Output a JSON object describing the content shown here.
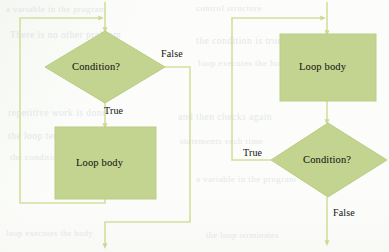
{
  "page": {
    "kind": "scanned-textbook-figure",
    "background_color": "#fcfdfa",
    "node_fill_color": "#c3d490",
    "node_stroke_color": "#b4c97f",
    "connector_color": "#d4de9e",
    "text_color": "#1c1b17"
  },
  "diagrams": [
    {
      "id": "while-loop",
      "name": "pre-test-loop-flowchart",
      "nodes": [
        {
          "id": "condition",
          "shape": "diamond",
          "label": "Condition?"
        },
        {
          "id": "body",
          "shape": "rectangle",
          "label": "Loop body"
        }
      ],
      "edges": [
        {
          "from": "entry",
          "to": "condition",
          "label": ""
        },
        {
          "from": "condition",
          "to": "body",
          "label": "True"
        },
        {
          "from": "condition",
          "to": "exit",
          "label": "False"
        },
        {
          "from": "body",
          "to": "condition",
          "label": ""
        }
      ]
    },
    {
      "id": "do-while-loop",
      "name": "post-test-loop-flowchart",
      "nodes": [
        {
          "id": "body",
          "shape": "rectangle",
          "label": "Loop body"
        },
        {
          "id": "condition",
          "shape": "diamond",
          "label": "Condition?"
        }
      ],
      "edges": [
        {
          "from": "entry",
          "to": "body",
          "label": ""
        },
        {
          "from": "body",
          "to": "condition",
          "label": ""
        },
        {
          "from": "condition",
          "to": "body",
          "label": "True"
        },
        {
          "from": "condition",
          "to": "exit",
          "label": "False"
        }
      ]
    }
  ],
  "labels": {
    "left_condition": "Condition?",
    "left_body": "Loop body",
    "left_true": "True",
    "left_false": "False",
    "right_body": "Loop body",
    "right_condition": "Condition?",
    "right_true": "True",
    "right_false": "False"
  },
  "bleed_through": {
    "lines": [
      "a variable in the program",
      "There is no other problem",
      "the condition is true and",
      "loop executes the body",
      "repetitive work is done",
      "and then checks again",
      "the loop terminates",
      "control structure",
      "statements each time"
    ]
  }
}
